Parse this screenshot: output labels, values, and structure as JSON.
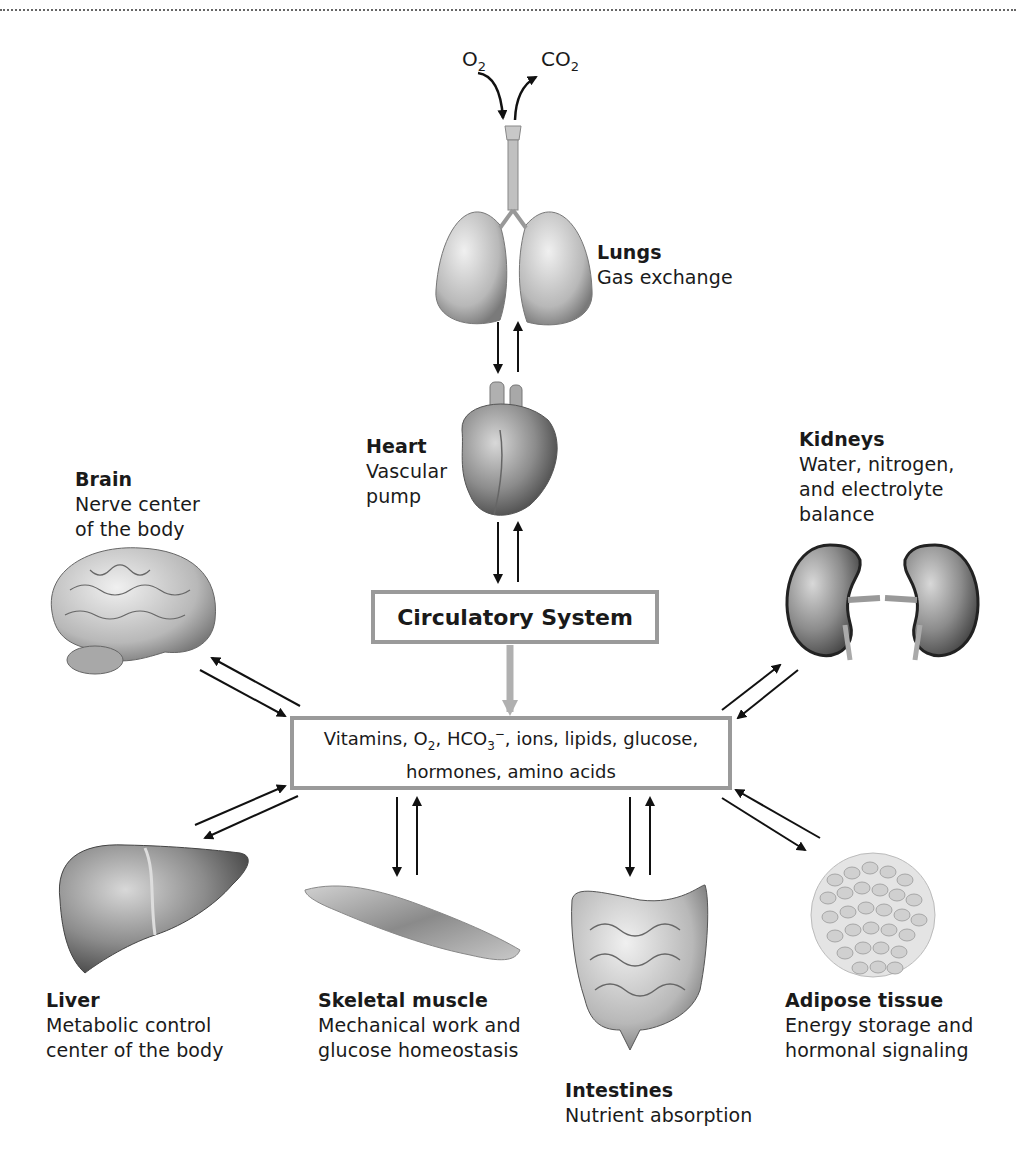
{
  "diagram": {
    "type": "hub-and-spoke physiology diagram",
    "gases": {
      "inhaled": {
        "base": "O",
        "sub": "2"
      },
      "exhaled": {
        "base": "CO",
        "sub": "2"
      }
    },
    "central_boxes": {
      "circulatory": "Circulatory System",
      "nutrients_line1_parts": {
        "p1": "Vitamins, O",
        "p1_sub": "2",
        "p2": ", HCO",
        "p2_sub": "3",
        "p2_sup": "−",
        "p3": ", ions, lipids, glucose,"
      },
      "nutrients_line2": "hormones, amino acids"
    },
    "organs": [
      {
        "id": "lungs",
        "title": "Lungs",
        "description": [
          "Gas exchange"
        ]
      },
      {
        "id": "heart",
        "title": "Heart",
        "description": [
          "Vascular",
          "pump"
        ]
      },
      {
        "id": "brain",
        "title": "Brain",
        "description": [
          "Nerve center",
          "of the body"
        ]
      },
      {
        "id": "kidneys",
        "title": "Kidneys",
        "description": [
          "Water, nitrogen,",
          "and electrolyte",
          "balance"
        ]
      },
      {
        "id": "liver",
        "title": "Liver",
        "description": [
          "Metabolic control",
          "center of the body"
        ]
      },
      {
        "id": "skeletal_muscle",
        "title": "Skeletal muscle",
        "description": [
          "Mechanical work and",
          "glucose homeostasis"
        ]
      },
      {
        "id": "intestines",
        "title": "Intestines",
        "description": [
          "Nutrient absorption"
        ]
      },
      {
        "id": "adipose",
        "title": "Adipose tissue",
        "description": [
          "Energy storage and",
          "hormonal signaling"
        ]
      }
    ],
    "colors": {
      "arrow": "#111111",
      "box_border": "#9a9a9a",
      "flow_arrow": "#b0b0b0",
      "organ_fill": "#8c8c8c"
    }
  }
}
